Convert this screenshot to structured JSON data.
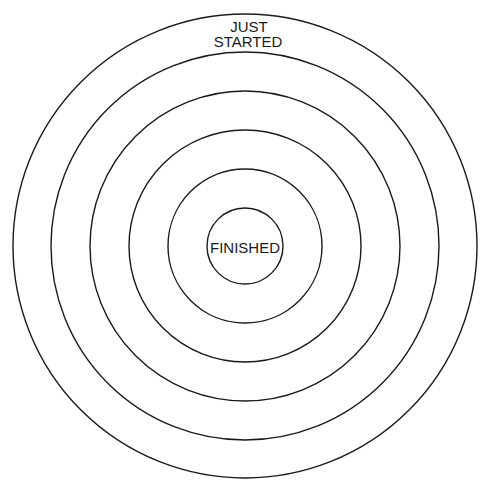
{
  "diagram": {
    "type": "concentric-circles-target",
    "center": {
      "x": 245,
      "y": 246
    },
    "stroke_color": "#1a1a1a",
    "background_color": "#ffffff",
    "rings": [
      {
        "radius": 232
      },
      {
        "radius": 194
      },
      {
        "radius": 155
      },
      {
        "radius": 116
      },
      {
        "radius": 77
      },
      {
        "radius": 38
      }
    ],
    "labels": {
      "outer_line1": "JUST",
      "outer_line2": "STARTED",
      "center": "FINISHED"
    }
  }
}
